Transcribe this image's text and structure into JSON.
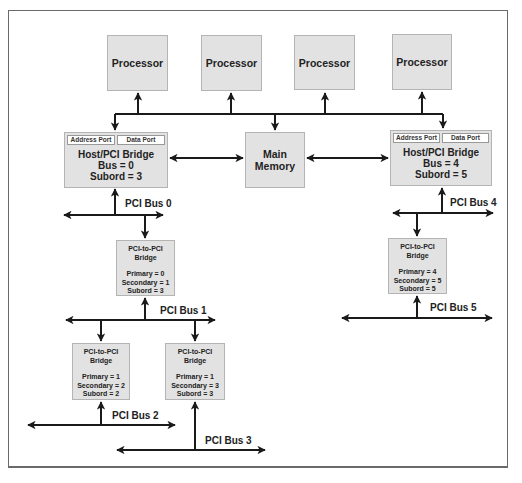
{
  "diagram": {
    "processors": [
      {
        "label": "Processor"
      },
      {
        "label": "Processor"
      },
      {
        "label": "Processor"
      },
      {
        "label": "Processor"
      }
    ],
    "main_memory": {
      "line1": "Main",
      "line2": "Memory"
    },
    "host_bridges": [
      {
        "address_port": "Address Port",
        "data_port": "Data Port",
        "title": "Host/PCI Bridge",
        "bus": "Bus = 0",
        "subord": "Subord = 3"
      },
      {
        "address_port": "Address Port",
        "data_port": "Data Port",
        "title": "Host/PCI Bridge",
        "bus": "Bus = 4",
        "subord": "Subord = 5"
      }
    ],
    "pci_bridges": [
      {
        "title1": "PCI-to-PCI",
        "title2": "Bridge",
        "primary": "Primary = 0",
        "secondary": "Secondary = 1",
        "subord": "Subord = 3"
      },
      {
        "title1": "PCI-to-PCI",
        "title2": "Bridge",
        "primary": "Primary = 1",
        "secondary": "Secondary = 2",
        "subord": "Subord = 2"
      },
      {
        "title1": "PCI-to-PCI",
        "title2": "Bridge",
        "primary": "Primary = 1",
        "secondary": "Secondary = 3",
        "subord": "Subord = 3"
      },
      {
        "title1": "PCI-to-PCI",
        "title2": "Bridge",
        "primary": "Primary = 4",
        "secondary": "Secondary = 5",
        "subord": "Subord = 5"
      }
    ],
    "buses": [
      {
        "label": "PCI Bus 0"
      },
      {
        "label": "PCI Bus 1"
      },
      {
        "label": "PCI Bus 2"
      },
      {
        "label": "PCI Bus 3"
      },
      {
        "label": "PCI Bus 4"
      },
      {
        "label": "PCI Bus 5"
      }
    ],
    "colors": {
      "box_fill": "#e2e2e2",
      "box_border": "#b4b4b4",
      "line": "#1a1a1a",
      "frame": "#6a6a6a"
    }
  }
}
